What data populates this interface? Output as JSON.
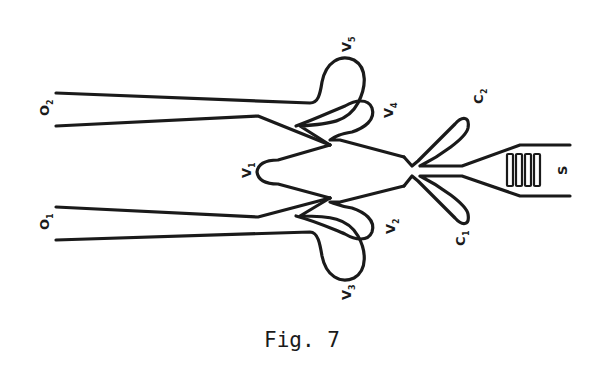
{
  "figure": {
    "caption": "Fig. 7",
    "stroke_color": "#1a1a1a",
    "background": "#ffffff"
  },
  "labels": {
    "O2": {
      "main": "O",
      "sub": "2"
    },
    "O1": {
      "main": "O",
      "sub": "1"
    },
    "V1": {
      "main": "V",
      "sub": "1"
    },
    "V2": {
      "main": "V",
      "sub": "2"
    },
    "V3": {
      "main": "V",
      "sub": "3"
    },
    "V4": {
      "main": "V",
      "sub": "4"
    },
    "V5": {
      "main": "V",
      "sub": "5"
    },
    "C1": {
      "main": "C",
      "sub": "1"
    },
    "C2": {
      "main": "C",
      "sub": "2"
    },
    "S": {
      "main": "S"
    }
  }
}
